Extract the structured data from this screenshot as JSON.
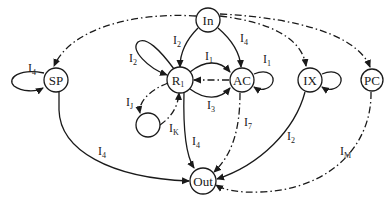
{
  "diagram": {
    "type": "state transition graph",
    "nodes": [
      {
        "id": "In",
        "label": "In",
        "sub": ""
      },
      {
        "id": "SP",
        "label": "SP",
        "sub": ""
      },
      {
        "id": "R1",
        "label": "R",
        "sub": "1"
      },
      {
        "id": "AC",
        "label": "AC",
        "sub": ""
      },
      {
        "id": "IX",
        "label": "IX",
        "sub": ""
      },
      {
        "id": "PC",
        "label": "PC",
        "sub": ""
      },
      {
        "id": "K",
        "label": "",
        "sub": ""
      },
      {
        "id": "Out",
        "label": "Out",
        "sub": ""
      }
    ],
    "edges": [
      {
        "from": "In",
        "to": "R1",
        "style": "solid",
        "label": "I",
        "sub": "2"
      },
      {
        "from": "In",
        "to": "AC",
        "style": "solid",
        "label": "I",
        "sub": "4"
      },
      {
        "from": "In",
        "to": "SP",
        "style": "dash-dot",
        "label": "",
        "sub": ""
      },
      {
        "from": "In",
        "to": "IX",
        "style": "dash-dot",
        "label": "",
        "sub": ""
      },
      {
        "from": "In",
        "to": "PC",
        "style": "dash-dot",
        "label": "",
        "sub": ""
      },
      {
        "from": "SP",
        "to": "SP",
        "style": "solid",
        "label": "I",
        "sub": "4"
      },
      {
        "from": "R1",
        "to": "R1",
        "style": "solid",
        "label": "I",
        "sub": "2"
      },
      {
        "from": "R1",
        "to": "AC",
        "style": "solid",
        "label": "I",
        "sub": "1"
      },
      {
        "from": "AC",
        "to": "R1",
        "style": "dash-dot",
        "label": "",
        "sub": ""
      },
      {
        "from": "R1",
        "to": "AC",
        "style": "solid",
        "label": "I",
        "sub": "3"
      },
      {
        "from": "AC",
        "to": "AC",
        "style": "solid",
        "label": "I",
        "sub": "1"
      },
      {
        "from": "IX",
        "to": "IX",
        "style": "solid",
        "label": "",
        "sub": ""
      },
      {
        "from": "R1",
        "to": "K",
        "style": "dash-dot",
        "label": "I",
        "sub": "J"
      },
      {
        "from": "K",
        "to": "R1",
        "style": "dash-dot",
        "label": "I",
        "sub": "K"
      },
      {
        "from": "SP",
        "to": "Out",
        "style": "solid",
        "label": "I",
        "sub": "4"
      },
      {
        "from": "R1",
        "to": "Out",
        "style": "solid",
        "label": "I",
        "sub": "4"
      },
      {
        "from": "AC",
        "to": "Out",
        "style": "dash-dot",
        "label": "I",
        "sub": "7"
      },
      {
        "from": "IX",
        "to": "Out",
        "style": "solid",
        "label": "I",
        "sub": "2"
      },
      {
        "from": "PC",
        "to": "Out",
        "style": "dash-dot",
        "label": "I",
        "sub": "M"
      }
    ]
  },
  "labels": {
    "in": "In",
    "sp": "SP",
    "r1_main": "R",
    "r1_sub": "1",
    "ac": "AC",
    "ix": "IX",
    "pc": "PC",
    "out": "Out",
    "I": "I",
    "e_in_r1_sub": "2",
    "e_in_ac_sub": "4",
    "e_sp_loop_sub": "4",
    "e_r1_loop_sub": "2",
    "e_r1_ac_top_sub": "1",
    "e_r1_ac_bottom_sub": "3",
    "e_ac_loop_sub": "1",
    "e_r1_k_sub": "J",
    "e_k_r1_sub": "K",
    "e_sp_out_sub": "4",
    "e_r1_out_sub": "4",
    "e_ac_out_sub": "7",
    "e_ix_out_sub": "2",
    "e_pc_out_sub": "M"
  },
  "colors": {
    "stroke": "#1a1a1a",
    "background": "#ffffff"
  }
}
